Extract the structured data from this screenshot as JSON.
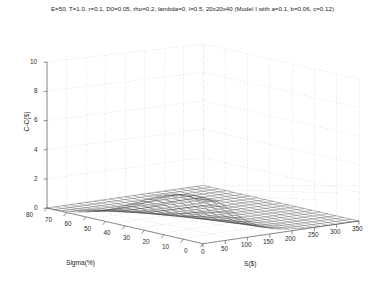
{
  "chart_data": {
    "type": "line",
    "title": "E=50, T=1.0, r=0.1, D0=0.05, rho=0.2, lambda=0, l=0.5, 20x20x40 (Model I with a=0.1, b=0.06, c=0.12)",
    "plot_style": "3d-mesh-surface",
    "projection": "matlab-default-3d",
    "grid": true,
    "grid_style": "dotted-light-gray",
    "legend": null,
    "xlabel": "S($)",
    "ylabel": "Sigma(%)",
    "zlabel": "C-C($)",
    "xlim": [
      0,
      350
    ],
    "ylim": [
      0,
      80
    ],
    "zlim": [
      0,
      10
    ],
    "xticks": [
      0,
      50,
      100,
      150,
      200,
      250,
      300,
      350
    ],
    "yticks": [
      0,
      10,
      20,
      30,
      40,
      50,
      60,
      70,
      80
    ],
    "zticks": [
      0,
      2,
      4,
      6,
      8,
      10
    ],
    "xtick_labels": [
      "0",
      "50",
      "100",
      "150",
      "200",
      "250",
      "300",
      "350"
    ],
    "ytick_labels": [
      "0",
      "10",
      "20",
      "30",
      "40",
      "50",
      "60",
      "70",
      "80"
    ],
    "ztick_labels": [
      "0",
      "2",
      "4",
      "6",
      "8",
      "10"
    ],
    "mesh_nx": 21,
    "mesh_ny": 21,
    "surface_values": {
      "sigma": [
        0,
        4,
        8,
        12,
        16,
        20,
        24,
        28,
        32,
        36,
        40,
        44,
        48,
        52,
        56,
        60,
        64,
        68,
        72,
        76,
        80
      ],
      "S": [
        0,
        17.5,
        35,
        52.5,
        70,
        87.5,
        105,
        122.5,
        140,
        157.5,
        175,
        192.5,
        210,
        227.5,
        245,
        262.5,
        280,
        297.5,
        315,
        332.5,
        350
      ],
      "z": [
        [
          0.0,
          0.0,
          0.0,
          0.0,
          0.0,
          0.0,
          0.0,
          0.0,
          0.0,
          0.0,
          0.0,
          0.0,
          0.0,
          0.0,
          0.0,
          0.0,
          0.0,
          0.0,
          0.0,
          0.0,
          0.0
        ],
        [
          0.02,
          0.02,
          0.01,
          0.01,
          0.01,
          0.0,
          0.0,
          0.0,
          0.0,
          0.0,
          0.0,
          0.0,
          0.0,
          0.0,
          0.0,
          0.0,
          0.0,
          0.0,
          0.0,
          0.0,
          0.0
        ],
        [
          0.06,
          0.06,
          0.04,
          0.03,
          0.02,
          0.01,
          0.01,
          0.0,
          0.0,
          0.0,
          0.0,
          0.0,
          0.0,
          0.0,
          0.0,
          0.0,
          0.0,
          0.0,
          0.0,
          0.0,
          0.0
        ],
        [
          0.13,
          0.12,
          0.09,
          0.06,
          0.04,
          0.03,
          0.02,
          0.01,
          0.01,
          0.0,
          0.0,
          0.0,
          0.0,
          0.0,
          0.0,
          0.0,
          0.0,
          0.0,
          0.0,
          0.0,
          0.0
        ],
        [
          0.22,
          0.21,
          0.16,
          0.11,
          0.07,
          0.05,
          0.03,
          0.02,
          0.01,
          0.01,
          0.0,
          0.0,
          0.0,
          0.0,
          0.0,
          0.0,
          0.0,
          0.0,
          0.0,
          0.0,
          0.0
        ],
        [
          0.34,
          0.32,
          0.25,
          0.17,
          0.12,
          0.08,
          0.05,
          0.03,
          0.02,
          0.01,
          0.01,
          0.0,
          0.0,
          0.0,
          0.0,
          0.0,
          0.0,
          0.0,
          0.0,
          0.0,
          0.0
        ],
        [
          0.49,
          0.46,
          0.36,
          0.25,
          0.17,
          0.11,
          0.07,
          0.05,
          0.03,
          0.02,
          0.01,
          0.01,
          0.0,
          0.0,
          0.0,
          0.0,
          0.0,
          0.0,
          0.0,
          0.0,
          0.0
        ],
        [
          0.67,
          0.63,
          0.49,
          0.35,
          0.24,
          0.16,
          0.1,
          0.07,
          0.04,
          0.03,
          0.02,
          0.01,
          0.01,
          0.0,
          0.0,
          0.0,
          0.0,
          0.0,
          0.0,
          0.0,
          0.0
        ],
        [
          0.88,
          0.82,
          0.65,
          0.46,
          0.32,
          0.21,
          0.14,
          0.09,
          0.06,
          0.04,
          0.02,
          0.01,
          0.01,
          0.01,
          0.0,
          0.0,
          0.0,
          0.0,
          0.0,
          0.0,
          0.0
        ],
        [
          1.11,
          1.04,
          0.83,
          0.59,
          0.41,
          0.28,
          0.18,
          0.12,
          0.08,
          0.05,
          0.03,
          0.02,
          0.01,
          0.01,
          0.0,
          0.0,
          0.0,
          0.0,
          0.0,
          0.0,
          0.0
        ],
        [
          1.37,
          1.28,
          1.03,
          0.74,
          0.51,
          0.35,
          0.23,
          0.15,
          0.1,
          0.06,
          0.04,
          0.03,
          0.02,
          0.01,
          0.01,
          0.0,
          0.0,
          0.0,
          0.0,
          0.0,
          0.0
        ],
        [
          1.64,
          1.54,
          1.24,
          0.9,
          0.63,
          0.43,
          0.29,
          0.19,
          0.13,
          0.08,
          0.05,
          0.03,
          0.02,
          0.01,
          0.01,
          0.01,
          0.0,
          0.0,
          0.0,
          0.0,
          0.0
        ],
        [
          1.92,
          1.81,
          1.47,
          1.07,
          0.76,
          0.52,
          0.35,
          0.23,
          0.15,
          0.1,
          0.07,
          0.04,
          0.03,
          0.02,
          0.01,
          0.01,
          0.0,
          0.0,
          0.0,
          0.0,
          0.0
        ],
        [
          2.2,
          2.08,
          1.71,
          1.26,
          0.89,
          0.62,
          0.42,
          0.28,
          0.19,
          0.12,
          0.08,
          0.05,
          0.03,
          0.02,
          0.01,
          0.01,
          0.01,
          0.0,
          0.0,
          0.0,
          0.0
        ],
        [
          2.47,
          2.35,
          1.95,
          1.45,
          1.04,
          0.73,
          0.5,
          0.33,
          0.22,
          0.15,
          0.1,
          0.06,
          0.04,
          0.03,
          0.02,
          0.01,
          0.01,
          0.01,
          0.0,
          0.0,
          0.0
        ],
        [
          2.7,
          2.59,
          2.18,
          1.64,
          1.19,
          0.84,
          0.58,
          0.39,
          0.26,
          0.17,
          0.11,
          0.07,
          0.05,
          0.03,
          0.02,
          0.01,
          0.01,
          0.01,
          0.0,
          0.0,
          0.0
        ],
        [
          2.87,
          2.78,
          2.38,
          1.82,
          1.34,
          0.95,
          0.66,
          0.45,
          0.3,
          0.2,
          0.13,
          0.09,
          0.06,
          0.04,
          0.02,
          0.02,
          0.01,
          0.01,
          0.01,
          0.0,
          0.0
        ],
        [
          2.97,
          2.91,
          2.54,
          1.98,
          1.48,
          1.07,
          0.75,
          0.51,
          0.35,
          0.23,
          0.15,
          0.1,
          0.07,
          0.04,
          0.03,
          0.02,
          0.01,
          0.01,
          0.01,
          0.0,
          0.0
        ],
        [
          3.0,
          2.97,
          2.65,
          2.12,
          1.61,
          1.18,
          0.84,
          0.58,
          0.39,
          0.26,
          0.18,
          0.12,
          0.08,
          0.05,
          0.03,
          0.02,
          0.01,
          0.01,
          0.01,
          0.0,
          0.0
        ],
        [
          2.96,
          2.96,
          2.7,
          2.22,
          1.72,
          1.28,
          0.92,
          0.64,
          0.44,
          0.3,
          0.2,
          0.13,
          0.09,
          0.06,
          0.04,
          0.02,
          0.02,
          0.01,
          0.01,
          0.01,
          0.0
        ],
        [
          2.86,
          2.9,
          2.7,
          2.27,
          1.8,
          1.37,
          1.0,
          0.71,
          0.49,
          0.33,
          0.22,
          0.15,
          0.1,
          0.06,
          0.04,
          0.03,
          0.02,
          0.01,
          0.01,
          0.01,
          0.0
        ]
      ]
    }
  },
  "figure": {
    "title": "E=50, T=1.0, r=0.1, D0=0.05, rho=0.2, lambda=0, l=0.5, 20x20x40 (Model I with a=0.1, b=0.06, c=0.12)",
    "axis_labels": {
      "x": "S($)",
      "y": "Sigma(%)",
      "z": "C-C($)"
    },
    "ticks": {
      "z": [
        "10",
        "8",
        "6",
        "4",
        "2",
        "0"
      ],
      "y": [
        "80",
        "70",
        "60",
        "50",
        "40",
        "30",
        "20",
        "10",
        "0"
      ],
      "x": [
        "0",
        "50",
        "100",
        "150",
        "200",
        "250",
        "300",
        "350"
      ]
    },
    "colors": {
      "background": "#ffffff",
      "axis_line": "#4d4d4d",
      "grid": "#c8c8c8",
      "mesh": "#333333",
      "text": "#1a1a1a"
    }
  }
}
